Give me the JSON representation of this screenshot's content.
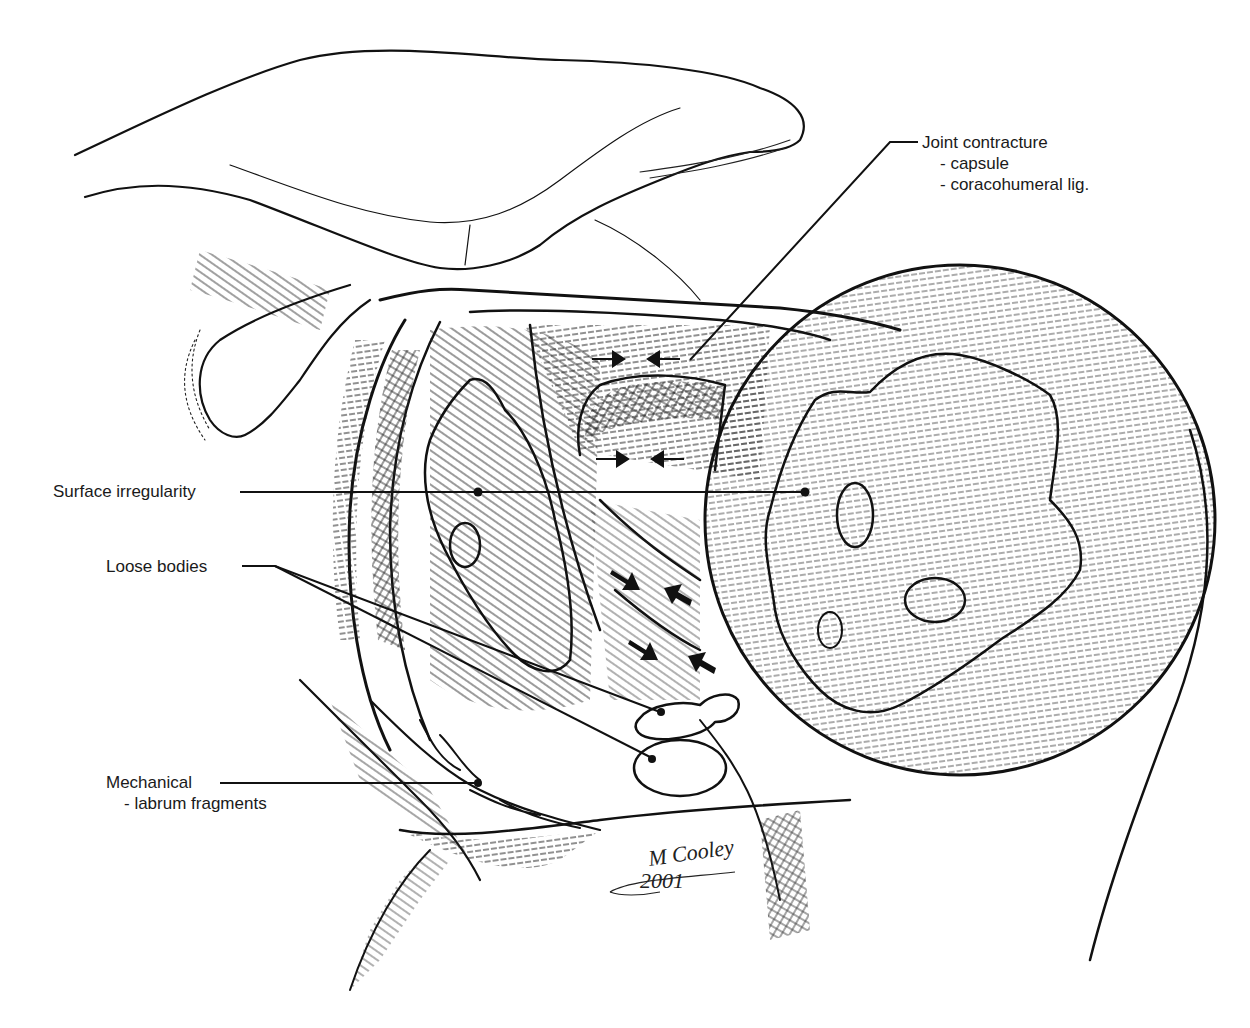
{
  "figure": {
    "background_color": "#ffffff",
    "ink_color": "#111111"
  },
  "labels": {
    "joint_contracture": {
      "title": "Joint contracture",
      "items": [
        "- capsule",
        "- coracohumeral lig."
      ]
    },
    "surface_irregularity": {
      "title": "Surface irregularity"
    },
    "loose_bodies": {
      "title": "Loose bodies"
    },
    "mechanical": {
      "title": "Mechanical",
      "items": [
        "- labrum fragments"
      ]
    }
  },
  "signature": {
    "name": "M Cooley",
    "year": "2001"
  }
}
